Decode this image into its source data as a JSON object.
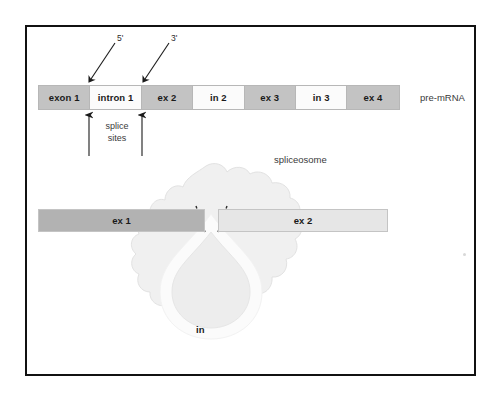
{
  "figure": {
    "background_color": "#ffffff",
    "frame_color": "#111111"
  },
  "premrna": {
    "label": "pre-mRNA",
    "exon_color": "#c3c3c3",
    "intron_color": "#fbfbfb",
    "segments": [
      {
        "label": "exon 1",
        "type": "exon"
      },
      {
        "label": "intron 1",
        "type": "intron"
      },
      {
        "label": "ex 2",
        "type": "exon"
      },
      {
        "label": "in 2",
        "type": "intron"
      },
      {
        "label": "ex 3",
        "type": "exon"
      },
      {
        "label": "in 3",
        "type": "intron"
      },
      {
        "label": "ex 4",
        "type": "exon"
      }
    ]
  },
  "annotations": {
    "five_prime": "5'",
    "three_prime": "3'",
    "splice_sites": "splice\nsites",
    "splice_sites_line1": "splice",
    "splice_sites_line2": "sites",
    "spliceosome": "spliceosome"
  },
  "spliced": {
    "left_exon": {
      "label": "ex 1",
      "color": "#b2b2b2"
    },
    "right_exon": {
      "label": "ex 2",
      "color": "#e6e6e6"
    },
    "intron_loop": {
      "label": "in",
      "fill": "#ededed",
      "ring": "#fbfbfb"
    }
  }
}
